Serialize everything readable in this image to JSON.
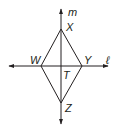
{
  "diagram": {
    "type": "rhombus-with-diagonals",
    "lines": {
      "vertical": {
        "label": "m"
      },
      "horizontal": {
        "label": "ℓ"
      }
    },
    "vertices": {
      "top": {
        "label": "X",
        "x": 61,
        "y": 29
      },
      "left": {
        "label": "W",
        "x": 41,
        "y": 66
      },
      "right": {
        "label": "Y",
        "x": 82,
        "y": 66
      },
      "bottom": {
        "label": "Z",
        "x": 61,
        "y": 103
      }
    },
    "intersection": {
      "label": "T",
      "x": 61,
      "y": 66
    },
    "colors": {
      "stroke": "#231f20",
      "background": "#ffffff"
    }
  }
}
